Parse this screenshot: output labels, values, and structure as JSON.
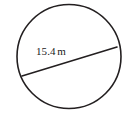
{
  "figure": {
    "type": "geometry-diagram",
    "shape": "circle",
    "background_color": "#ffffff",
    "stroke_color": "#231f20",
    "text_color": "#1a1a1a",
    "circle": {
      "center_x": 69,
      "center_y": 56.5,
      "radius": 52,
      "stroke_width": 1.6
    },
    "chord": {
      "label_value": "15.4",
      "label_unit": "m",
      "label_full": "15.4 m",
      "x1": 22,
      "y1": 76,
      "x2": 117,
      "y2": 47,
      "stroke_width": 1.6
    }
  }
}
